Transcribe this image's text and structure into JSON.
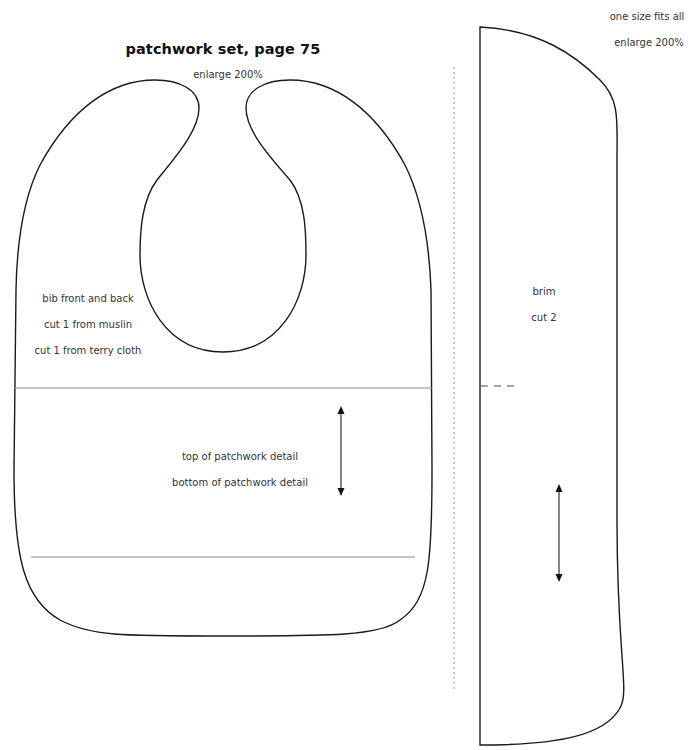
{
  "bib": {
    "title": "patchwork set, page 75",
    "enlarge": "enlarge 200%",
    "labels": [
      "bib front and back",
      "cut 1 from muslin",
      "cut 1 from terry cloth"
    ],
    "patchwork_top": "top of patchwork detail",
    "patchwork_bottom": "bottom of patchwork detail"
  },
  "brim": {
    "size_note": "one size fits all",
    "enlarge": "enlarge 200%",
    "name": "brim",
    "cut": "cut 2"
  },
  "colors": {
    "outline": "#1a1a1a",
    "guide_line": "#8a8a8a",
    "fold_line": "#b5b5b5",
    "text": "#333333"
  }
}
